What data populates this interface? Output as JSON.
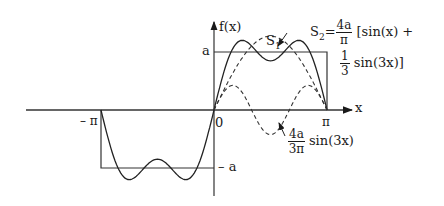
{
  "figure": {
    "y_axis_label": "f(x)",
    "x_axis_label": "x",
    "origin_label": "0",
    "tick_pi": "π",
    "tick_neg_pi": "– π",
    "level_a": "a",
    "level_neg_a": "– a",
    "s1_label": "S",
    "s1_sub": "1",
    "s2_label": "S",
    "s2_sub": "2",
    "s2_eq": "=",
    "s2_coef_num": "4a",
    "s2_coef_den": "π",
    "s2_bracket_open": "[sin(x) +",
    "s2_frac_num": "1",
    "s2_frac_den": "3",
    "s2_bracket_close": "sin(3x)]",
    "term3_coef_num": "4a",
    "term3_coef_den": "3π",
    "term3_func": "sin(3x)"
  },
  "chart_data": {
    "type": "line",
    "xlabel": "x",
    "ylabel": "f(x)",
    "x_ticks": [
      "-π",
      "0",
      "π"
    ],
    "y_ticks": [
      "-a",
      "a"
    ],
    "xlim": [
      -3.1416,
      3.1416
    ],
    "ylim_in_a": [
      -1,
      1
    ],
    "series": [
      {
        "name": "square wave f(x)",
        "style": "solid",
        "definition": "f(x) = -a for -π<x<0, a for 0<x<π",
        "domain": [
          -3.1416,
          3.1416
        ]
      },
      {
        "name": "S2",
        "style": "solid",
        "definition": "(4a/π)[sin(x) + (1/3) sin(3x)]",
        "domain": [
          -3.1416,
          3.1416
        ]
      },
      {
        "name": "S1",
        "style": "dashed",
        "definition": "(4a/π) sin(x)",
        "domain": [
          0,
          3.1416
        ]
      },
      {
        "name": "third harmonic",
        "style": "dashed",
        "definition": "(4a/3π) sin(3x)",
        "domain": [
          0,
          3.1416
        ]
      }
    ]
  }
}
